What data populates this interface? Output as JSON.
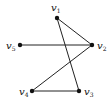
{
  "graph": {
    "nodes": [
      {
        "id": "v1",
        "name": "v",
        "sub": "1",
        "x": 57,
        "y": 18,
        "lx": 51,
        "ly": 11
      },
      {
        "id": "v2",
        "name": "v",
        "sub": "2",
        "x": 92,
        "y": 45,
        "lx": 97,
        "ly": 49
      },
      {
        "id": "v3",
        "name": "v",
        "sub": "3",
        "x": 79,
        "y": 91,
        "lx": 84,
        "ly": 95
      },
      {
        "id": "v4",
        "name": "v",
        "sub": "4",
        "x": 32,
        "y": 91,
        "lx": 19,
        "ly": 95
      },
      {
        "id": "v5",
        "name": "v",
        "sub": "5",
        "x": 20,
        "y": 45,
        "lx": 6,
        "ly": 49
      }
    ],
    "edges": [
      [
        "v1",
        "v2"
      ],
      [
        "v1",
        "v3"
      ],
      [
        "v5",
        "v2"
      ],
      [
        "v2",
        "v4"
      ],
      [
        "v4",
        "v3"
      ]
    ],
    "colors": {
      "edge": "#222222",
      "node": "#111111"
    }
  }
}
